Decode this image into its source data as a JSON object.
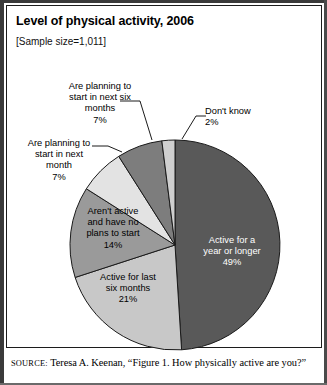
{
  "figure": {
    "title": "Level of physical activity, 2006",
    "sample_size": "[Sample size=1,011]",
    "source_prefix": "SOURCE:",
    "source_text": " Teresa A. Keenan, “Figure 1. How physically active are you?”"
  },
  "chart_data": {
    "type": "pie",
    "title": "Level of physical activity, 2006",
    "subtitle": "[Sample size=1,011]",
    "unit": "percent",
    "total": 100,
    "start_angle_deg": 0,
    "direction": "clockwise",
    "legend": "none-labels-on-slices",
    "categories": [
      "Active for a year or longer",
      "Active for last six months",
      "Aren't active and have no plans to start",
      "Are planning to start in next month",
      "Are planning to start in next six months",
      "Don't know"
    ],
    "values": [
      49,
      21,
      14,
      7,
      7,
      2
    ],
    "slices": [
      {
        "label": "Active for a year or longer",
        "label_lines": [
          "Active for a",
          "year or longer"
        ],
        "value": 49,
        "value_label": "49%",
        "color": "#595959",
        "text_color": "#ffffff",
        "label_placement": "inside"
      },
      {
        "label": "Active for last six months",
        "label_lines": [
          "Active for last",
          "six months"
        ],
        "value": 21,
        "value_label": "21%",
        "color": "#c8c8c8",
        "text_color": "#000000",
        "label_placement": "inside"
      },
      {
        "label": "Aren't active and have no plans to start",
        "label_lines": [
          "Aren't active",
          "and have no",
          "plans to start"
        ],
        "value": 14,
        "value_label": "14%",
        "color": "#9a9a9a",
        "text_color": "#000000",
        "label_placement": "inside"
      },
      {
        "label": "Are planning to start in next month",
        "label_lines": [
          "Are planning to",
          "start in next",
          "month"
        ],
        "value": 7,
        "value_label": "7%",
        "color": "#e3e3e3",
        "text_color": "#000000",
        "label_placement": "outside-leader"
      },
      {
        "label": "Are planning to start in next six months",
        "label_lines": [
          "Are planning to",
          "start in next six",
          "months"
        ],
        "value": 7,
        "value_label": "7%",
        "color": "#7d7d7d",
        "text_color": "#000000",
        "label_placement": "outside-leader"
      },
      {
        "label": "Don't know",
        "label_lines": [
          "Don't know"
        ],
        "value": 2,
        "value_label": "2%",
        "color": "#cfcfcf",
        "text_color": "#000000",
        "label_placement": "outside-leader"
      }
    ]
  },
  "labels": {
    "plan_six_months": "Are planning to\nstart in next six\nmonths\n7%",
    "plan_next_month": "Are planning to\nstart in next\nmonth\n7%",
    "dont_know": "Don't know\n2%",
    "not_active": "Aren't active\nand have no\nplans to start\n14%",
    "last_six_months": "Active for last\nsix months\n21%",
    "year_or_longer": "Active for a\nyear or longer\n49%"
  }
}
